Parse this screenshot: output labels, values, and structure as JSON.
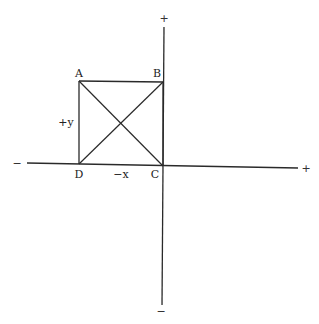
{
  "diagram": {
    "type": "coordinate-axes-with-square",
    "colors": {
      "line": "#2a2a2a",
      "text": "#222222",
      "background": "#ffffff"
    },
    "axes": {
      "horizontal": {
        "negative_label": "−",
        "positive_label": "+",
        "axis_label": "−x"
      },
      "vertical": {
        "positive_label": "+",
        "negative_label": "−",
        "axis_label": "+y"
      }
    },
    "vertices": [
      {
        "id": "A",
        "label": "A"
      },
      {
        "id": "B",
        "label": "B"
      },
      {
        "id": "C",
        "label": "C"
      },
      {
        "id": "D",
        "label": "D"
      }
    ],
    "edges": [
      "AB",
      "BC",
      "CD",
      "DA"
    ],
    "diagonals": [
      "AC",
      "BD"
    ]
  }
}
